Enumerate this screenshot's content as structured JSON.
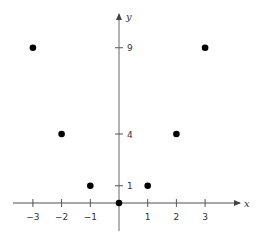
{
  "chart_data": {
    "type": "scatter",
    "title": "",
    "xlabel": "x",
    "ylabel": "y",
    "x": [
      -3,
      -2,
      -1,
      0,
      1,
      2,
      3
    ],
    "y": [
      9,
      4,
      1,
      0,
      1,
      4,
      9
    ],
    "x_ticks": [
      "−3",
      "−2",
      "−1",
      "1",
      "2",
      "3"
    ],
    "y_ticks": [
      "1",
      "4",
      "9"
    ],
    "xlim": [
      -3.7,
      4.2
    ],
    "ylim": [
      -1.6,
      11
    ],
    "grid": false,
    "legend": null,
    "point_color": "#000000",
    "axis_color": "#8a8a8a"
  },
  "axes": {
    "x_label": "x",
    "y_label": "y"
  }
}
